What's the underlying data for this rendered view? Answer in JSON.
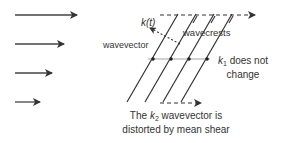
{
  "diagram": {
    "type": "shear-wave-distortion",
    "labels": {
      "k_t": "k(t)",
      "wavevector": "wavevector",
      "wavecrests": "wavecrests",
      "k1_symbol": "k",
      "k1_sub": "1",
      "k1_line1": " does not",
      "k1_line2": "change",
      "caption_pre": "The ",
      "caption_k": "k",
      "caption_sub": "2",
      "caption_post": " wavevector is",
      "caption_line2": "distorted by mean shear"
    },
    "flow_arrows": [
      {
        "name": "flow-arrow-1",
        "length": "longest"
      },
      {
        "name": "flow-arrow-2",
        "length": "long"
      },
      {
        "name": "flow-arrow-3",
        "length": "medium"
      },
      {
        "name": "flow-arrow-4",
        "length": "short"
      }
    ],
    "colors": {
      "stroke": "#333333",
      "text": "#333333",
      "grid_line": "#999999"
    }
  }
}
